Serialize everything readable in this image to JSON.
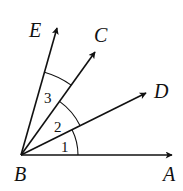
{
  "diagram": {
    "vertex": {
      "name": "B",
      "x": 21,
      "y": 155
    },
    "rays": [
      {
        "name": "A",
        "tip": [
          172,
          155
        ],
        "label_pos": [
          163,
          181
        ]
      },
      {
        "name": "D",
        "tip": [
          146,
          93
        ],
        "label_pos": [
          154,
          98
        ]
      },
      {
        "name": "C",
        "tip": [
          95,
          52
        ],
        "label_pos": [
          94,
          42
        ]
      },
      {
        "name": "E",
        "tip": [
          57,
          28
        ],
        "label_pos": [
          29,
          37
        ]
      }
    ],
    "angles": [
      {
        "label": "1",
        "between": [
          "A",
          "D"
        ],
        "radius": 57,
        "label_pos": [
          61,
          152
        ]
      },
      {
        "label": "2",
        "between": [
          "D",
          "C"
        ],
        "radius": 66,
        "label_pos": [
          54,
          132
        ]
      },
      {
        "label": "3",
        "between": [
          "C",
          "E"
        ],
        "radius": 86,
        "label_pos": [
          44,
          103
        ]
      }
    ],
    "vertex_label_pos": [
      14,
      181
    ],
    "stroke_color": "#111111"
  }
}
